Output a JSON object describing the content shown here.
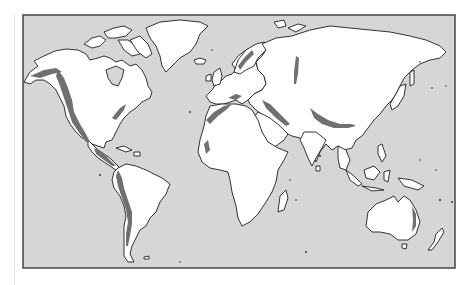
{
  "map": {
    "type": "world-map",
    "projection": "Miller cylindrical",
    "subject": "Major mountain belts of the world",
    "colors": {
      "ocean": "#d6d6d6",
      "land": "#ffffff",
      "coastline": "#1e1e1e",
      "mountain_belt": "#707070",
      "frame": "#444444"
    },
    "legend": [
      {
        "symbol": "dark-gray-fill",
        "meaning": "mountain belt"
      }
    ],
    "highlighted_regions": [
      "Alaska Range",
      "North American Cordillera",
      "Appalachians",
      "Central American ranges",
      "Andes",
      "Atlas Mountains",
      "Alps",
      "Caucasus / Zagros",
      "Urals",
      "Himalaya / Tibetan Plateau",
      "Scandinavian Mountains",
      "Great Dividing Range"
    ]
  }
}
